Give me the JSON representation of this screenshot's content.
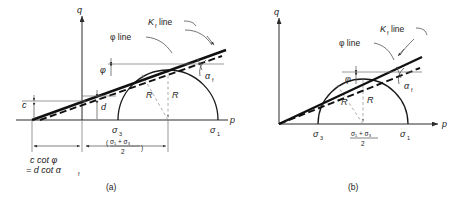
{
  "figure": {
    "title": "",
    "panels": [
      {
        "id": "a",
        "caption": "(a)",
        "axis_y_label": "q",
        "axis_x_label": "p",
        "labels": {
          "kf_line": "K",
          "kf_line_sub": "f",
          "kf_line_word": "line",
          "phi_line": "φ line",
          "phi_angle": "φ",
          "alpha_angle": "α",
          "alpha_sub": "f",
          "radius_left": "R",
          "radius_right": "R",
          "intercept_c": "c",
          "intercept_d": "d",
          "sigma3": "σ",
          "sigma3_sub": "3",
          "sigma1": "σ",
          "sigma1_sub": "1",
          "mean_stress_num": "σ₁ + σ₃",
          "mean_stress_den": "2",
          "dim_line1": "c cot φ",
          "dim_line2": "= d  cot α",
          "dim_line2_sub": "f"
        }
      },
      {
        "id": "b",
        "caption": "(b)",
        "axis_y_label": "q",
        "axis_x_label": "p",
        "labels": {
          "kf_line": "K",
          "kf_line_sub": "f",
          "kf_line_word": "line",
          "phi_line": "φ line",
          "phi_angle": "φ",
          "alpha_angle": "α",
          "alpha_sub": "f",
          "radius_left": "R",
          "radius_right": "R",
          "sigma3": "σ",
          "sigma3_sub": "3",
          "sigma1": "σ",
          "sigma1_sub": "1",
          "mean_stress_num": "σ₁ + σ₃",
          "mean_stress_den": "2"
        }
      }
    ],
    "colors": {
      "background": "#ffffff",
      "ink": "#1a1a1a",
      "thick_line": "#111111",
      "thin_guide": "#6d6d6d"
    }
  }
}
